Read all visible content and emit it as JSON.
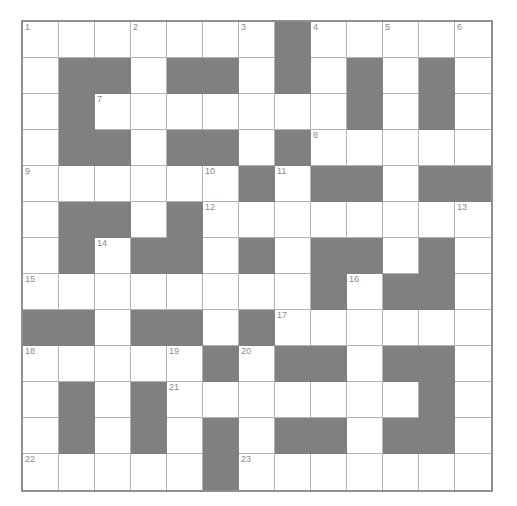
{
  "puzzle": {
    "title": "Crossword Grid",
    "type": "crossword",
    "rows": 13,
    "cols": 13,
    "cell_size_px": 36,
    "colors": {
      "block": "#808080",
      "open": "#ffffff",
      "grid_line": "#b3b3b3",
      "border": "#8f8f8f",
      "number_text": "#8a8a8a"
    },
    "numbers_present": [
      1,
      2,
      3,
      4,
      5,
      6,
      7,
      8,
      9,
      10,
      11,
      12,
      13,
      14,
      15,
      16,
      17,
      18,
      19,
      20,
      21,
      22,
      23
    ],
    "grid": [
      [
        {
          "block": false,
          "number": "1"
        },
        {
          "block": false,
          "number": ""
        },
        {
          "block": false,
          "number": ""
        },
        {
          "block": false,
          "number": "2"
        },
        {
          "block": false,
          "number": ""
        },
        {
          "block": false,
          "number": ""
        },
        {
          "block": false,
          "number": "3"
        },
        {
          "block": true,
          "number": ""
        },
        {
          "block": false,
          "number": "4"
        },
        {
          "block": false,
          "number": ""
        },
        {
          "block": false,
          "number": "5"
        },
        {
          "block": false,
          "number": ""
        },
        {
          "block": false,
          "number": "6"
        }
      ],
      [
        {
          "block": false,
          "number": ""
        },
        {
          "block": true,
          "number": ""
        },
        {
          "block": true,
          "number": ""
        },
        {
          "block": false,
          "number": ""
        },
        {
          "block": true,
          "number": ""
        },
        {
          "block": true,
          "number": ""
        },
        {
          "block": false,
          "number": ""
        },
        {
          "block": true,
          "number": ""
        },
        {
          "block": false,
          "number": ""
        },
        {
          "block": true,
          "number": ""
        },
        {
          "block": false,
          "number": ""
        },
        {
          "block": true,
          "number": ""
        },
        {
          "block": false,
          "number": ""
        }
      ],
      [
        {
          "block": false,
          "number": ""
        },
        {
          "block": true,
          "number": ""
        },
        {
          "block": false,
          "number": "7"
        },
        {
          "block": false,
          "number": ""
        },
        {
          "block": false,
          "number": ""
        },
        {
          "block": false,
          "number": ""
        },
        {
          "block": false,
          "number": ""
        },
        {
          "block": false,
          "number": ""
        },
        {
          "block": false,
          "number": ""
        },
        {
          "block": true,
          "number": ""
        },
        {
          "block": false,
          "number": ""
        },
        {
          "block": true,
          "number": ""
        },
        {
          "block": false,
          "number": ""
        }
      ],
      [
        {
          "block": false,
          "number": ""
        },
        {
          "block": true,
          "number": ""
        },
        {
          "block": true,
          "number": ""
        },
        {
          "block": false,
          "number": ""
        },
        {
          "block": true,
          "number": ""
        },
        {
          "block": true,
          "number": ""
        },
        {
          "block": false,
          "number": ""
        },
        {
          "block": true,
          "number": ""
        },
        {
          "block": false,
          "number": "8"
        },
        {
          "block": false,
          "number": ""
        },
        {
          "block": false,
          "number": ""
        },
        {
          "block": false,
          "number": ""
        },
        {
          "block": false,
          "number": ""
        }
      ],
      [
        {
          "block": false,
          "number": "9"
        },
        {
          "block": false,
          "number": ""
        },
        {
          "block": false,
          "number": ""
        },
        {
          "block": false,
          "number": ""
        },
        {
          "block": false,
          "number": ""
        },
        {
          "block": false,
          "number": "10"
        },
        {
          "block": true,
          "number": ""
        },
        {
          "block": false,
          "number": "11"
        },
        {
          "block": true,
          "number": ""
        },
        {
          "block": true,
          "number": ""
        },
        {
          "block": false,
          "number": ""
        },
        {
          "block": true,
          "number": ""
        },
        {
          "block": true,
          "number": ""
        }
      ],
      [
        {
          "block": false,
          "number": ""
        },
        {
          "block": true,
          "number": ""
        },
        {
          "block": true,
          "number": ""
        },
        {
          "block": false,
          "number": ""
        },
        {
          "block": true,
          "number": ""
        },
        {
          "block": false,
          "number": "12"
        },
        {
          "block": false,
          "number": ""
        },
        {
          "block": false,
          "number": ""
        },
        {
          "block": false,
          "number": ""
        },
        {
          "block": false,
          "number": ""
        },
        {
          "block": false,
          "number": ""
        },
        {
          "block": false,
          "number": ""
        },
        {
          "block": false,
          "number": "13"
        }
      ],
      [
        {
          "block": false,
          "number": ""
        },
        {
          "block": true,
          "number": ""
        },
        {
          "block": false,
          "number": "14"
        },
        {
          "block": true,
          "number": ""
        },
        {
          "block": true,
          "number": ""
        },
        {
          "block": false,
          "number": ""
        },
        {
          "block": true,
          "number": ""
        },
        {
          "block": false,
          "number": ""
        },
        {
          "block": true,
          "number": ""
        },
        {
          "block": true,
          "number": ""
        },
        {
          "block": false,
          "number": ""
        },
        {
          "block": true,
          "number": ""
        },
        {
          "block": false,
          "number": ""
        }
      ],
      [
        {
          "block": false,
          "number": "15"
        },
        {
          "block": false,
          "number": ""
        },
        {
          "block": false,
          "number": ""
        },
        {
          "block": false,
          "number": ""
        },
        {
          "block": false,
          "number": ""
        },
        {
          "block": false,
          "number": ""
        },
        {
          "block": false,
          "number": ""
        },
        {
          "block": false,
          "number": ""
        },
        {
          "block": true,
          "number": ""
        },
        {
          "block": false,
          "number": "16"
        },
        {
          "block": true,
          "number": ""
        },
        {
          "block": true,
          "number": ""
        },
        {
          "block": false,
          "number": ""
        }
      ],
      [
        {
          "block": true,
          "number": ""
        },
        {
          "block": true,
          "number": ""
        },
        {
          "block": false,
          "number": ""
        },
        {
          "block": true,
          "number": ""
        },
        {
          "block": true,
          "number": ""
        },
        {
          "block": false,
          "number": ""
        },
        {
          "block": true,
          "number": ""
        },
        {
          "block": false,
          "number": "17"
        },
        {
          "block": false,
          "number": ""
        },
        {
          "block": false,
          "number": ""
        },
        {
          "block": false,
          "number": ""
        },
        {
          "block": false,
          "number": ""
        },
        {
          "block": false,
          "number": ""
        }
      ],
      [
        {
          "block": false,
          "number": "18"
        },
        {
          "block": false,
          "number": ""
        },
        {
          "block": false,
          "number": ""
        },
        {
          "block": false,
          "number": ""
        },
        {
          "block": false,
          "number": "19"
        },
        {
          "block": true,
          "number": ""
        },
        {
          "block": false,
          "number": "20"
        },
        {
          "block": true,
          "number": ""
        },
        {
          "block": true,
          "number": ""
        },
        {
          "block": false,
          "number": ""
        },
        {
          "block": true,
          "number": ""
        },
        {
          "block": true,
          "number": ""
        },
        {
          "block": false,
          "number": ""
        }
      ],
      [
        {
          "block": false,
          "number": ""
        },
        {
          "block": true,
          "number": ""
        },
        {
          "block": false,
          "number": ""
        },
        {
          "block": true,
          "number": ""
        },
        {
          "block": false,
          "number": "21"
        },
        {
          "block": false,
          "number": ""
        },
        {
          "block": false,
          "number": ""
        },
        {
          "block": false,
          "number": ""
        },
        {
          "block": false,
          "number": ""
        },
        {
          "block": false,
          "number": ""
        },
        {
          "block": false,
          "number": ""
        },
        {
          "block": true,
          "number": ""
        },
        {
          "block": false,
          "number": ""
        }
      ],
      [
        {
          "block": false,
          "number": ""
        },
        {
          "block": true,
          "number": ""
        },
        {
          "block": false,
          "number": ""
        },
        {
          "block": true,
          "number": ""
        },
        {
          "block": false,
          "number": ""
        },
        {
          "block": true,
          "number": ""
        },
        {
          "block": false,
          "number": ""
        },
        {
          "block": true,
          "number": ""
        },
        {
          "block": true,
          "number": ""
        },
        {
          "block": false,
          "number": ""
        },
        {
          "block": true,
          "number": ""
        },
        {
          "block": true,
          "number": ""
        },
        {
          "block": false,
          "number": ""
        }
      ],
      [
        {
          "block": false,
          "number": "22"
        },
        {
          "block": false,
          "number": ""
        },
        {
          "block": false,
          "number": ""
        },
        {
          "block": false,
          "number": ""
        },
        {
          "block": false,
          "number": ""
        },
        {
          "block": true,
          "number": ""
        },
        {
          "block": false,
          "number": "23"
        },
        {
          "block": false,
          "number": ""
        },
        {
          "block": false,
          "number": ""
        },
        {
          "block": false,
          "number": ""
        },
        {
          "block": false,
          "number": ""
        },
        {
          "block": false,
          "number": ""
        },
        {
          "block": false,
          "number": ""
        }
      ]
    ]
  }
}
